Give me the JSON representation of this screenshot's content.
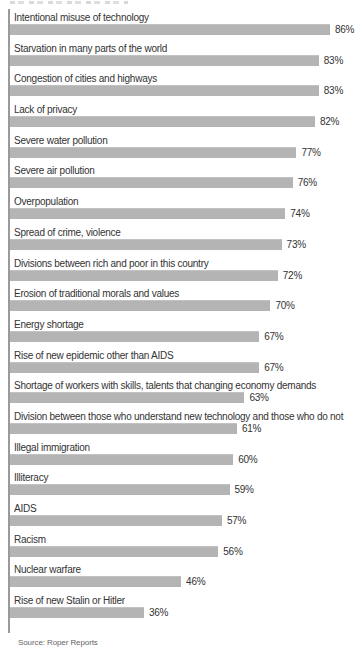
{
  "page": {
    "source_note": "Source: Roper Reports",
    "colors": {
      "bar": "#b4b4b4",
      "axis": "#9a9a9a",
      "label_text": "#333333",
      "source_text": "#666666",
      "background": "#ffffff"
    }
  },
  "chart_data": {
    "type": "bar",
    "orientation": "horizontal",
    "unit": "%",
    "xlim": [
      0,
      100
    ],
    "grid": false,
    "legend": false,
    "value_labels": "right-of-bar",
    "categories": [
      "Intentional misuse of technology",
      "Starvation in many parts of the world",
      "Congestion of cities and highways",
      "Lack of privacy",
      "Severe water pollution",
      "Severe air pollution",
      "Overpopulation",
      "Spread of crime, violence",
      "Divisions between rich and poor in this country",
      "Erosion of traditional morals and values",
      "Energy shortage",
      "Rise of new epidemic other than AIDS",
      "Shortage of workers with skills, talents that changing economy demands",
      "Division between those who understand new technology and those who do not",
      "Illegal immigration",
      "Illiteracy",
      "AIDS",
      "Racism",
      "Nuclear warfare",
      "Rise of new Stalin or Hitler"
    ],
    "values": [
      86,
      83,
      83,
      82,
      77,
      76,
      74,
      73,
      72,
      70,
      67,
      67,
      63,
      61,
      60,
      59,
      57,
      56,
      46,
      36
    ],
    "source": "Source: Roper Reports"
  }
}
